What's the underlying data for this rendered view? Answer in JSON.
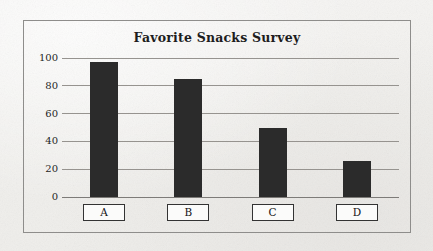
{
  "chart_data": {
    "type": "bar",
    "title": "Favorite Snacks Survey",
    "xlabel": "",
    "ylabel": "",
    "categories": [
      "A",
      "B",
      "C",
      "D"
    ],
    "values": [
      97,
      85,
      50,
      26
    ],
    "yticks": [
      "0",
      "20",
      "40",
      "60",
      "80",
      "100"
    ],
    "ytick_values": [
      0,
      20,
      40,
      60,
      80,
      100
    ],
    "ylim": [
      0,
      100
    ],
    "grid": true,
    "legend": false,
    "legend_position": "none",
    "bar_color": "#2b2b2b",
    "background_color": "#f3f2f0",
    "frame_color": "#8e8d8b",
    "gridline_color": "#96938f",
    "label_box_border_color": "#333333",
    "label_box_fill": "#fbfbfa",
    "text_color": "#1d1d1d"
  }
}
